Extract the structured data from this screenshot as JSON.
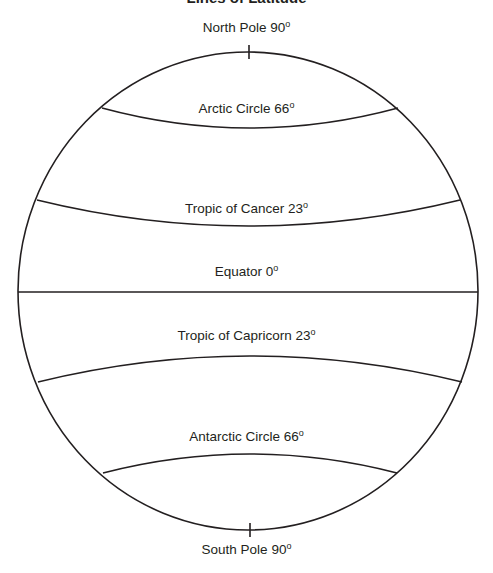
{
  "title": "Lines of Latitude",
  "labels": {
    "north_pole": {
      "text": "North Pole 90",
      "sup": "o"
    },
    "arctic": {
      "text": "Arctic Circle 66",
      "sup": "o"
    },
    "cancer": {
      "text": "Tropic of Cancer 23",
      "sup": "o"
    },
    "equator": {
      "text": "Equator 0",
      "sup": "o"
    },
    "capricorn": {
      "text": "Tropic of Capricorn 23",
      "sup": "o"
    },
    "antarctic": {
      "text": "Antarctic Circle 66",
      "sup": "o"
    },
    "south_pole": {
      "text": "South Pole 90",
      "sup": "o"
    }
  },
  "colors": {
    "line": "#231f20",
    "background": "#ffffff"
  }
}
